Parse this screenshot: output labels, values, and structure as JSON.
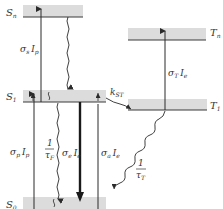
{
  "diagram": {
    "type": "energy-level (Jablonski) diagram",
    "levels": {
      "Sn": {
        "main": "S",
        "sub": "n"
      },
      "S1": {
        "main": "S",
        "sub": "1"
      },
      "S0": {
        "main": "S",
        "sub": "0"
      },
      "Tn": {
        "main": "T",
        "sub": "n"
      },
      "T1": {
        "main": "T",
        "sub": "1"
      }
    },
    "transitions": {
      "sigma_s": {
        "sym": "σ",
        "sub": "s",
        "I": "I",
        "isub": "p"
      },
      "sigma_p": {
        "sym": "σ",
        "sub": "p",
        "I": "I",
        "isub": "p"
      },
      "tau_f": {
        "num": "1",
        "den": "τ",
        "densub": "F"
      },
      "sigma_e": {
        "sym": "σ",
        "sub": "e",
        "I": "I",
        "isub": "e"
      },
      "sigma_a": {
        "sym": "σ",
        "sub": "a",
        "I": "I",
        "isub": "e"
      },
      "k_st": {
        "main": "k",
        "sub": "ST"
      },
      "sigma_t": {
        "sym": "σ",
        "sub": "T",
        "I": "I",
        "isub": "e"
      },
      "tau_t": {
        "num": "1",
        "den": "τ",
        "densub": "T"
      }
    },
    "colors": {
      "band": "#d9d9d9",
      "line": "#3a3a3a",
      "text": "#333333"
    }
  }
}
